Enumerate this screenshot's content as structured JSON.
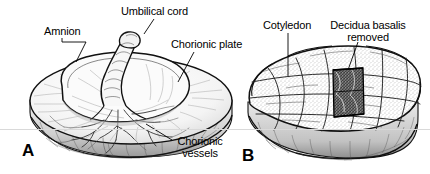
{
  "figure": {
    "type": "anatomical-illustration",
    "background_color": "#ffffff",
    "ink_color": "#000000"
  },
  "panels": [
    {
      "letter": "A",
      "description": "Fetal surface of placenta with amnion reflected, umbilical cord insertion and chorionic vessels"
    },
    {
      "letter": "B",
      "description": "Maternal surface of placenta showing cotyledons and a window where decidua basalis has been removed"
    }
  ],
  "labels": {
    "amnion": "Amnion",
    "umbilical_cord": "Umbilical cord",
    "chorionic_plate": "Chorionic plate",
    "chorionic_vessels_line1": "Chorionic",
    "chorionic_vessels_line2": "vessels",
    "cotyledon": "Cotyledon",
    "decidua_line1": "Decidua basalis",
    "decidua_line2": "removed"
  }
}
